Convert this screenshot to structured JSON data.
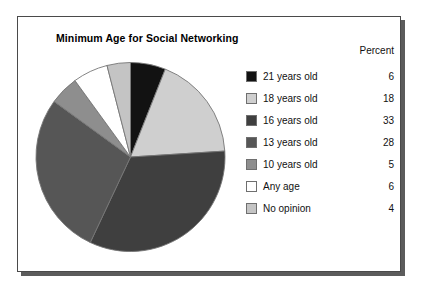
{
  "chart": {
    "title": "Minimum Age for Social Networking"
  },
  "legend": {
    "header_percent": "Percent"
  },
  "chart_data": {
    "type": "pie",
    "title": "Minimum Age for Social Networking",
    "xlabel": "",
    "ylabel": "",
    "value_unit": "percent",
    "value_column_header": "Percent",
    "legend_position": "right",
    "grid": false,
    "start_angle_deg": 0,
    "direction": "clockwise",
    "categories": [
      "21 years old",
      "18 years old",
      "16 years old",
      "13 years old",
      "10 years old",
      "Any age",
      "No opinion"
    ],
    "values": [
      6,
      18,
      33,
      28,
      5,
      6,
      4
    ],
    "colors": [
      "#121212",
      "#cfcfcf",
      "#3f3f3f",
      "#565656",
      "#8e8e8e",
      "#ffffff",
      "#c4c4c4"
    ],
    "slices": [
      {
        "label": "21 years old",
        "value": 6,
        "color": "#121212"
      },
      {
        "label": "18 years old",
        "value": 18,
        "color": "#cfcfcf"
      },
      {
        "label": "16 years old",
        "value": 33,
        "color": "#3f3f3f"
      },
      {
        "label": "13 years old",
        "value": 28,
        "color": "#565656"
      },
      {
        "label": "10 years old",
        "value": 5,
        "color": "#8e8e8e"
      },
      {
        "label": "Any age",
        "value": 6,
        "color": "#ffffff"
      },
      {
        "label": "No opinion",
        "value": 4,
        "color": "#c4c4c4"
      }
    ]
  }
}
